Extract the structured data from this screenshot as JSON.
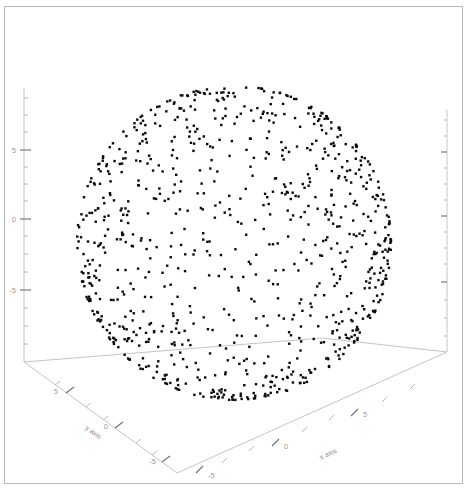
{
  "figure": {
    "title": "",
    "background_color": "#ffffff",
    "border_color": "#b9b9b9",
    "width": 468,
    "height": 491
  },
  "chart_data": {
    "type": "scatter",
    "projection": "3d",
    "title": "",
    "xlabel": "x axis",
    "ylabel": "y axis",
    "zlabel": "",
    "xlim": [
      -7.5,
      7.5
    ],
    "ylim": [
      -7.5,
      7.5
    ],
    "zlim": [
      -7.5,
      7.5
    ],
    "xticks": [
      -5,
      0,
      5
    ],
    "yticks": [
      -5,
      0,
      5
    ],
    "zticks": [
      -5,
      0,
      5
    ],
    "xticklabels": [
      "-5",
      "0",
      "5"
    ],
    "yticklabels": [
      "5",
      "0",
      "-5"
    ],
    "zticklabels": [
      "5",
      "0",
      "-5"
    ],
    "grid": false,
    "legend": null,
    "marker": "square",
    "marker_color": "#0a0a0a",
    "marker_size": 2.4,
    "n_points": 900,
    "sphere_radius": 5,
    "sphere_center": [
      0,
      0,
      0
    ],
    "series": [
      {
        "name": "sphere surface samples",
        "distribution": "uniform-on-sphere",
        "count": 900,
        "radius": 5
      }
    ]
  },
  "axes": {
    "z_axis": {
      "name": "z-axis-left",
      "ticks": [
        {
          "label": "5",
          "major": true
        },
        {
          "label": "0",
          "major": true
        },
        {
          "label": "-5",
          "major": true
        }
      ]
    },
    "y_axis": {
      "name": "y-axis-floor-left",
      "title": "y axis",
      "ticks": [
        {
          "label": "5",
          "major": true
        },
        {
          "label": "0",
          "major": true
        },
        {
          "label": "-5",
          "major": true
        }
      ]
    },
    "x_axis": {
      "name": "x-axis-floor-right",
      "title": "x axis",
      "ticks": [
        {
          "label": "-5",
          "major": true
        },
        {
          "label": "0",
          "major": true
        },
        {
          "label": "5",
          "major": true
        }
      ]
    },
    "right_axis": {
      "name": "z-axis-right",
      "ticks": []
    }
  }
}
